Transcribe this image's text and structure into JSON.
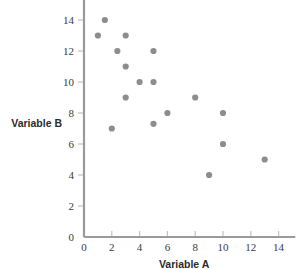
{
  "chart_data": {
    "type": "scatter",
    "title": "",
    "xlabel": "Variable A",
    "ylabel": "Variable B",
    "xlim": [
      0,
      15
    ],
    "ylim": [
      0,
      15
    ],
    "xticks": [
      0,
      2,
      4,
      6,
      8,
      10,
      12,
      14
    ],
    "yticks": [
      0,
      2,
      4,
      6,
      8,
      10,
      12,
      14
    ],
    "xtick_labels": [
      "0",
      "2",
      "4",
      "6",
      "8",
      "10",
      "12",
      "14"
    ],
    "ytick_labels": [
      "0",
      "2",
      "4",
      "6",
      "8",
      "10",
      "12",
      "14"
    ],
    "grid": false,
    "legend": false,
    "marker_color": "#8d8d8d",
    "axis_color": "#9a9a9a",
    "points": [
      {
        "x": 1.5,
        "y": 14.0
      },
      {
        "x": 1.0,
        "y": 13.0
      },
      {
        "x": 3.0,
        "y": 13.0
      },
      {
        "x": 2.4,
        "y": 12.0
      },
      {
        "x": 5.0,
        "y": 12.0
      },
      {
        "x": 3.0,
        "y": 11.0
      },
      {
        "x": 4.0,
        "y": 10.0
      },
      {
        "x": 5.0,
        "y": 10.0
      },
      {
        "x": 3.0,
        "y": 9.0
      },
      {
        "x": 8.0,
        "y": 9.0
      },
      {
        "x": 6.0,
        "y": 8.0
      },
      {
        "x": 10.0,
        "y": 8.0
      },
      {
        "x": 5.0,
        "y": 7.3
      },
      {
        "x": 2.0,
        "y": 7.0
      },
      {
        "x": 10.0,
        "y": 6.0
      },
      {
        "x": 13.0,
        "y": 5.0
      },
      {
        "x": 9.0,
        "y": 4.0
      }
    ]
  }
}
